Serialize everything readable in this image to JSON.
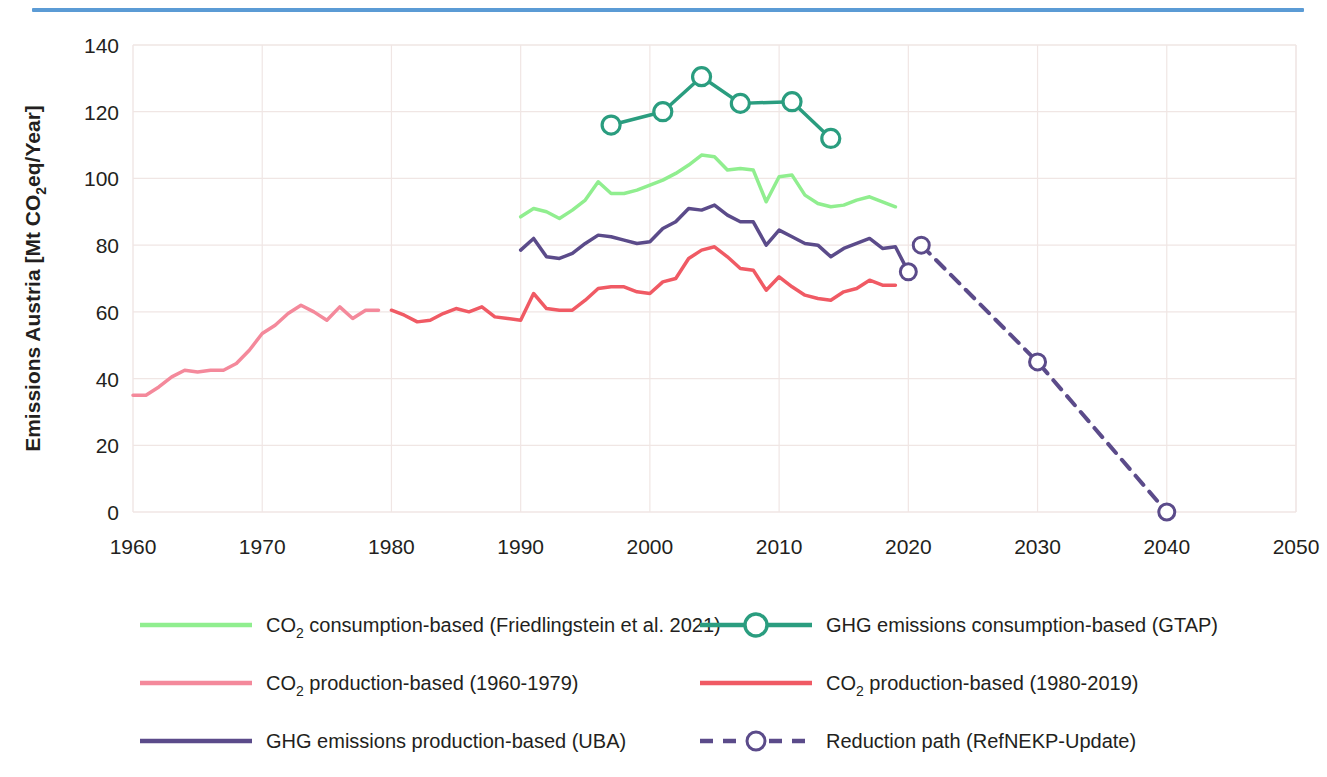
{
  "figure": {
    "top_rule_color": "#5b9bd5",
    "background": "#ffffff",
    "grid_color": "#f0e6e4"
  },
  "chart_data": {
    "type": "line",
    "title": "",
    "xlabel": "",
    "ylabel": "Emissions Austria [Mt CO2eq/Year]",
    "ylabel_parts": {
      "pre": "Emissions Austria [Mt CO",
      "sub": "2",
      "post": "eq/Year]"
    },
    "xlim": [
      1960,
      2050
    ],
    "ylim": [
      0,
      140
    ],
    "xticks": [
      1960,
      1970,
      1980,
      1990,
      2000,
      2010,
      2020,
      2030,
      2040,
      2050
    ],
    "yticks": [
      0,
      20,
      40,
      60,
      80,
      100,
      120,
      140
    ],
    "grid": true,
    "legend_position": "bottom",
    "series": [
      {
        "name": "CO2 consumption-based (Friedlingstein et al. 2021)",
        "key": "co2_consumption_friedlingstein",
        "color": "#90ee8f",
        "width": 3.5,
        "dash": "none",
        "marker": "none",
        "x": [
          1990,
          1991,
          1992,
          1993,
          1994,
          1995,
          1996,
          1997,
          1998,
          1999,
          2000,
          2001,
          2002,
          2003,
          2004,
          2005,
          2006,
          2007,
          2008,
          2009,
          2010,
          2011,
          2012,
          2013,
          2014,
          2015,
          2016,
          2017,
          2018,
          2019
        ],
        "y": [
          88.5,
          91.0,
          90.0,
          88.0,
          90.5,
          93.5,
          99.0,
          95.5,
          95.5,
          96.5,
          98.0,
          99.5,
          101.5,
          104.0,
          107.0,
          106.5,
          102.5,
          103.0,
          102.5,
          93.0,
          100.5,
          101.0,
          95.0,
          92.5,
          91.5,
          92.0,
          93.5,
          94.5,
          93.0,
          91.5
        ]
      },
      {
        "name": "CO2 production-based (1960-1979)",
        "key": "co2_production_early",
        "color": "#f4899b",
        "width": 3.5,
        "dash": "none",
        "marker": "none",
        "x": [
          1960,
          1961,
          1962,
          1963,
          1964,
          1965,
          1966,
          1967,
          1968,
          1969,
          1970,
          1971,
          1972,
          1973,
          1974,
          1975,
          1976,
          1977,
          1978,
          1979
        ],
        "y": [
          35.0,
          35.0,
          37.5,
          40.5,
          42.5,
          42.0,
          42.5,
          42.5,
          44.5,
          48.5,
          53.5,
          56.0,
          59.5,
          62.0,
          60.0,
          57.5,
          61.5,
          58.0,
          60.5,
          60.5
        ]
      },
      {
        "name": "CO2 production-based (1980-2019)",
        "key": "co2_production_late",
        "color": "#f05a64",
        "width": 3.5,
        "dash": "none",
        "marker": "none",
        "x": [
          1980,
          1981,
          1982,
          1983,
          1984,
          1985,
          1986,
          1987,
          1988,
          1989,
          1990,
          1991,
          1992,
          1993,
          1994,
          1995,
          1996,
          1997,
          1998,
          1999,
          2000,
          2001,
          2002,
          2003,
          2004,
          2005,
          2006,
          2007,
          2008,
          2009,
          2010,
          2011,
          2012,
          2013,
          2014,
          2015,
          2016,
          2017,
          2018,
          2019
        ],
        "y": [
          60.5,
          59.0,
          57.0,
          57.5,
          59.5,
          61.0,
          60.0,
          61.5,
          58.5,
          58.0,
          57.5,
          65.5,
          61.0,
          60.5,
          60.5,
          63.5,
          67.0,
          67.5,
          67.5,
          66.0,
          65.5,
          69.0,
          70.0,
          76.0,
          78.5,
          79.5,
          76.5,
          73.0,
          72.5,
          66.5,
          70.5,
          67.5,
          65.0,
          64.0,
          63.5,
          66.0,
          67.0,
          69.5,
          68.0,
          68.0
        ]
      },
      {
        "name": "GHG emissions consumption-based (GTAP)",
        "key": "ghg_consumption_gtap",
        "color": "#2a9d7f",
        "width": 3.5,
        "dash": "none",
        "marker": "circle",
        "x": [
          1997,
          2001,
          2004,
          2007,
          2011,
          2014
        ],
        "y": [
          116.0,
          120.0,
          130.5,
          122.5,
          123.0,
          112.0
        ]
      },
      {
        "name": "GHG emissions production-based  (UBA)",
        "key": "ghg_production_uba",
        "color": "#5b4b8a",
        "width": 3.5,
        "dash": "none",
        "marker": "endpoint",
        "x": [
          1990,
          1991,
          1992,
          1993,
          1994,
          1995,
          1996,
          1997,
          1998,
          1999,
          2000,
          2001,
          2002,
          2003,
          2004,
          2005,
          2006,
          2007,
          2008,
          2009,
          2010,
          2011,
          2012,
          2013,
          2014,
          2015,
          2016,
          2017,
          2018,
          2019,
          2020
        ],
        "y": [
          78.5,
          82.0,
          76.5,
          76.0,
          77.5,
          80.5,
          83.0,
          82.5,
          81.5,
          80.5,
          81.0,
          85.0,
          87.0,
          91.0,
          90.5,
          92.0,
          89.0,
          87.0,
          87.0,
          80.0,
          84.5,
          82.5,
          80.5,
          80.0,
          76.5,
          79.0,
          80.5,
          82.0,
          79.0,
          79.5,
          72.0
        ]
      },
      {
        "name": "Reduction path (RefNEKP-Update)",
        "key": "reduction_path",
        "color": "#5b4b8a",
        "width": 4.0,
        "dash": "12,9",
        "marker": "circle-open",
        "x": [
          2021,
          2030,
          2040
        ],
        "y": [
          80.0,
          45.0,
          0.0
        ]
      }
    ]
  },
  "legend": {
    "entries": [
      {
        "label": "CO",
        "sub": "2",
        "rest": " consumption-based (Friedlingstein et al. 2021)",
        "series_key": "co2_consumption_friedlingstein"
      },
      {
        "label": "GHG emissions consumption-based (GTAP)",
        "sub": "",
        "rest": "",
        "series_key": "ghg_consumption_gtap"
      },
      {
        "label": "CO",
        "sub": "2",
        "rest": " production-based (1960-1979)",
        "series_key": "co2_production_early"
      },
      {
        "label": "CO",
        "sub": "2",
        "rest": " production-based (1980-2019)",
        "series_key": "co2_production_late"
      },
      {
        "label": "GHG emissions production-based  (UBA)",
        "sub": "",
        "rest": "",
        "series_key": "ghg_production_uba"
      },
      {
        "label": "Reduction path (RefNEKP-Update)",
        "sub": "",
        "rest": "",
        "series_key": "reduction_path"
      }
    ]
  }
}
